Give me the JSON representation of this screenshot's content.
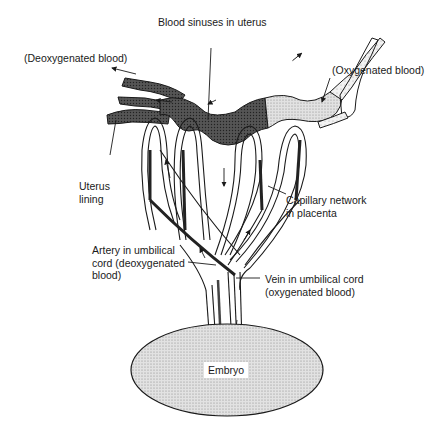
{
  "diagram": {
    "labels": {
      "blood_sinuses": "Blood sinuses in uterus",
      "deoxygenated_blood": "(Deoxygenated blood)",
      "oxygenated_blood": "(Oxygenated blood)",
      "uterus_lining": "Uterus\nlining",
      "capillary_network": "Capillary network\nin placenta",
      "umbilical_artery": "Artery in umbilical\ncord (deoxygenated\nblood)",
      "umbilical_vein": "Vein in umbilical cord\n(oxygenated blood)",
      "embryo": "Embryo"
    },
    "colors": {
      "ink": "#1a1a1a",
      "deoxygenated_fill": "#3a3a3a",
      "oxygenated_fill": "#e8e8e8",
      "embryo_fill": "#d4d4d4",
      "background": "#ffffff"
    }
  }
}
